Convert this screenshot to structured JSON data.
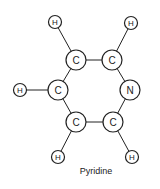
{
  "diagram": {
    "title": "Pyridine",
    "atoms": [
      {
        "id": "h1",
        "symbol": "H",
        "x": 55,
        "y": 22,
        "r": 6.5
      },
      {
        "id": "h2",
        "symbol": "H",
        "x": 131,
        "y": 23,
        "r": 6.5
      },
      {
        "id": "c1",
        "symbol": "C",
        "x": 76,
        "y": 60,
        "r": 10
      },
      {
        "id": "c2",
        "symbol": "C",
        "x": 112,
        "y": 60,
        "r": 10
      },
      {
        "id": "h3",
        "symbol": "H",
        "x": 20,
        "y": 90,
        "r": 6.5
      },
      {
        "id": "c3",
        "symbol": "C",
        "x": 58,
        "y": 90,
        "r": 10
      },
      {
        "id": "n1",
        "symbol": "N",
        "x": 130,
        "y": 90,
        "r": 10
      },
      {
        "id": "c4",
        "symbol": "C",
        "x": 76,
        "y": 122,
        "r": 10
      },
      {
        "id": "c5",
        "symbol": "C",
        "x": 113,
        "y": 122,
        "r": 10
      },
      {
        "id": "h4",
        "symbol": "H",
        "x": 58,
        "y": 157,
        "r": 6.5
      },
      {
        "id": "h5",
        "symbol": "H",
        "x": 132,
        "y": 157,
        "r": 6.5
      }
    ],
    "bonds": [
      [
        "h1",
        "c1"
      ],
      [
        "h2",
        "c2"
      ],
      [
        "c1",
        "c2"
      ],
      [
        "c1",
        "c3"
      ],
      [
        "c2",
        "n1"
      ],
      [
        "h3",
        "c3"
      ],
      [
        "c3",
        "c4"
      ],
      [
        "n1",
        "c5"
      ],
      [
        "c4",
        "c5"
      ],
      [
        "c4",
        "h4"
      ],
      [
        "c5",
        "h5"
      ]
    ]
  }
}
